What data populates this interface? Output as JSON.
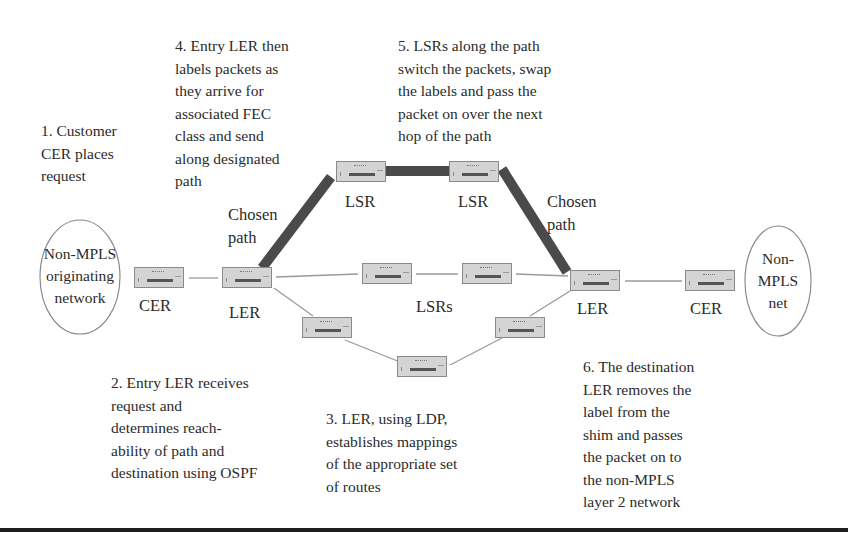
{
  "diagram": {
    "steps": {
      "step1": "1. Customer\nCER places\nrequest",
      "step2": "2. Entry LER receives\nrequest and\ndetermines reach-\nability of path and\ndestination using OSPF",
      "step3": "3. LER, using LDP,\nestablishes mappings\nof the appropriate set\nof routes",
      "step4": "4. Entry LER then\nlabels packets as\nthey arrive for\nassociated FEC\nclass and send\nalong designated\npath",
      "step5": "5. LSRs along the path\nswitch the packets, swap\nthe labels and pass the\npacket on over the next\nhop of the path",
      "step6": "6. The destination\nLER removes the\nlabel from the\nshim and passes\nthe packet on to\nthe non-MPLS\nlayer 2 network"
    },
    "networks": {
      "origin": "Non-MPLS\noriginating\nnetwork",
      "destination": "Non-\nMPLS\nnet"
    },
    "labels": {
      "cer_left": "CER",
      "ler_left": "LER",
      "lsr_top_left": "LSR",
      "lsr_top_right": "LSR",
      "lsrs_middle": "LSRs",
      "ler_right": "LER",
      "cer_right": "CER",
      "chosen_path_left": "Chosen\npath",
      "chosen_path_right": "Chosen\npath"
    },
    "nodes": [
      {
        "id": "cer-left",
        "type": "CER",
        "x": 134,
        "y": 267
      },
      {
        "id": "ler-left",
        "type": "LER",
        "x": 222,
        "y": 267
      },
      {
        "id": "lsr-top-left",
        "type": "LSR",
        "x": 336,
        "y": 161
      },
      {
        "id": "lsr-top-right",
        "type": "LSR",
        "x": 449,
        "y": 161
      },
      {
        "id": "lsr-mid-left",
        "type": "LSR",
        "x": 362,
        "y": 263
      },
      {
        "id": "lsr-mid-right",
        "type": "LSR",
        "x": 462,
        "y": 263
      },
      {
        "id": "lsr-low-left",
        "type": "LSR",
        "x": 302,
        "y": 317
      },
      {
        "id": "lsr-low-mid",
        "type": "LSR",
        "x": 397,
        "y": 356
      },
      {
        "id": "lsr-low-right",
        "type": "LSR",
        "x": 495,
        "y": 317
      },
      {
        "id": "ler-right",
        "type": "LER",
        "x": 570,
        "y": 270
      },
      {
        "id": "cer-right",
        "type": "CER",
        "x": 685,
        "y": 270
      }
    ],
    "colors": {
      "chosen_path": "#4a4a4a",
      "link": "#9a9a9a",
      "device_fill": "#d4d4d4",
      "device_border": "#8a8a8a",
      "rule": "#1e1e1e"
    }
  }
}
